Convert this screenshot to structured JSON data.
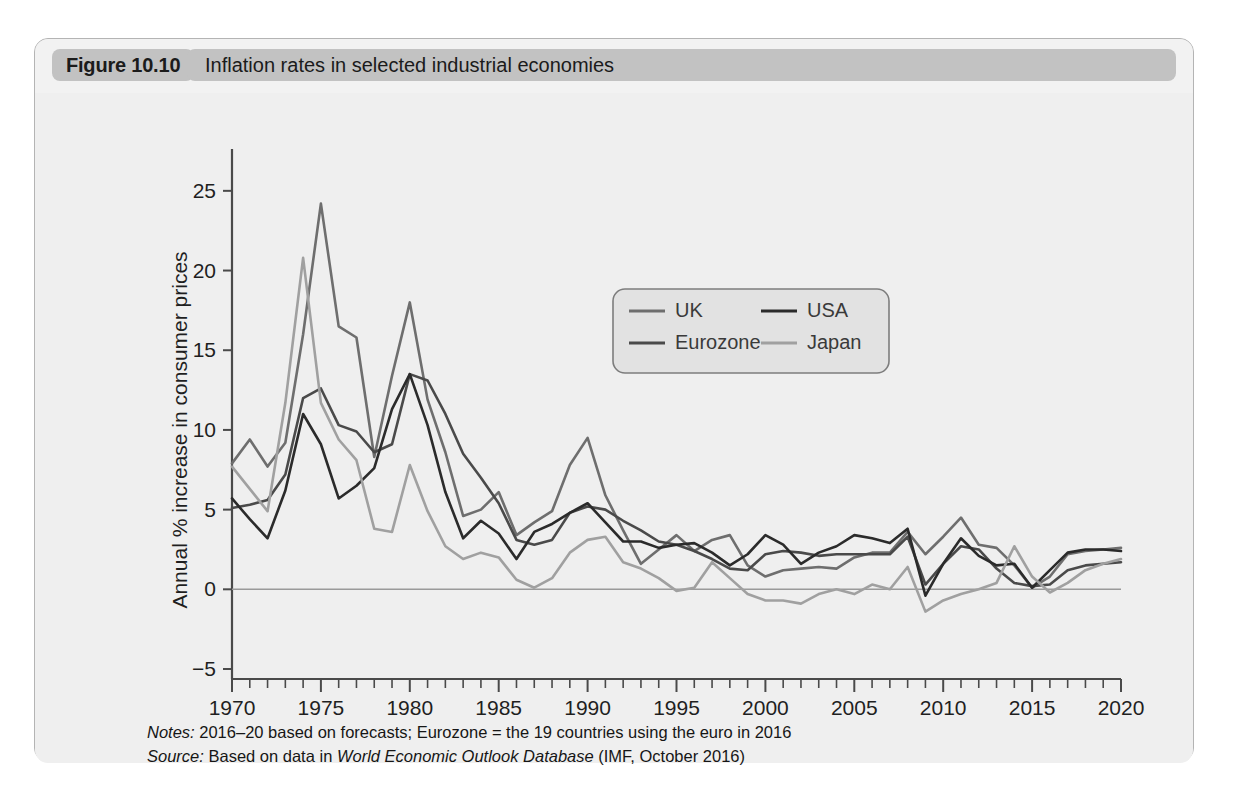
{
  "figure": {
    "badge_label": "Figure 10.10",
    "title": "Inflation rates in selected industrial economies"
  },
  "notes": {
    "notes_lead": "Notes:",
    "notes_text": " 2016–20 based on forecasts; Eurozone = the 19 countries using the euro in 2016",
    "source_lead": "Source:",
    "source_pre": " Based on data in ",
    "source_italic": "World Economic Outlook Database",
    "source_post": " (IMF, October 2016)"
  },
  "colors": {
    "uk": "#6e6e6e",
    "eurozone": "#4a4a4a",
    "usa": "#2b2b2b",
    "japan": "#a0a0a0",
    "axis": "#4a4a4a",
    "zero_line": "#9a9a9a",
    "panel_bg": "#efefef",
    "card_bg": "#d4d4d4",
    "badge_bg": "#c2c2c2"
  },
  "chart_data": {
    "type": "line",
    "title": "Inflation rates in selected industrial economies",
    "xlabel": "",
    "ylabel": "Annual % increase in consumer prices",
    "xlim": [
      1970,
      2020
    ],
    "ylim": [
      -5,
      27.5
    ],
    "yticks": [
      -5,
      0,
      5,
      10,
      15,
      20,
      25
    ],
    "ytick_labels": [
      "−5",
      "0",
      "5",
      "10",
      "15",
      "20",
      "25"
    ],
    "xticks": [
      1970,
      1975,
      1980,
      1985,
      1990,
      1995,
      2000,
      2005,
      2010,
      2015,
      2020
    ],
    "xtick_labels": [
      "1970",
      "1975",
      "1980",
      "1985",
      "1990",
      "1995",
      "2000",
      "2005",
      "2010",
      "2015",
      "2020"
    ],
    "minor_xtick_interval": 1,
    "grid": false,
    "zero_line": true,
    "legend_position": "upper-center",
    "x": [
      1970,
      1971,
      1972,
      1973,
      1974,
      1975,
      1976,
      1977,
      1978,
      1979,
      1980,
      1981,
      1982,
      1983,
      1984,
      1985,
      1986,
      1987,
      1988,
      1989,
      1990,
      1991,
      1992,
      1993,
      1994,
      1995,
      1996,
      1997,
      1998,
      1999,
      2000,
      2001,
      2002,
      2003,
      2004,
      2005,
      2006,
      2007,
      2008,
      2009,
      2010,
      2011,
      2012,
      2013,
      2014,
      2015,
      2016,
      2017,
      2018,
      2019,
      2020
    ],
    "series": [
      {
        "name": "UK",
        "color": "#6e6e6e",
        "values": [
          7.9,
          9.4,
          7.7,
          9.2,
          16.0,
          24.2,
          16.5,
          15.8,
          8.3,
          13.4,
          18.0,
          11.9,
          8.6,
          4.6,
          5.0,
          6.1,
          3.4,
          4.2,
          4.9,
          7.8,
          9.5,
          5.9,
          3.7,
          1.6,
          2.5,
          3.4,
          2.4,
          3.1,
          3.4,
          1.5,
          0.8,
          1.2,
          1.3,
          1.4,
          1.3,
          2.0,
          2.3,
          2.3,
          3.6,
          2.2,
          3.3,
          4.5,
          2.8,
          2.6,
          1.5,
          0.1,
          0.8,
          2.2,
          2.4,
          2.5,
          2.6
        ]
      },
      {
        "name": "Eurozone",
        "color": "#4a4a4a",
        "values": [
          5.1,
          5.3,
          5.6,
          7.2,
          12.0,
          12.6,
          10.3,
          9.9,
          8.6,
          9.1,
          13.5,
          13.1,
          11.0,
          8.5,
          7.0,
          5.4,
          3.1,
          2.8,
          3.1,
          4.8,
          5.2,
          5.0,
          4.3,
          3.7,
          3.0,
          2.8,
          2.4,
          1.9,
          1.3,
          1.2,
          2.2,
          2.4,
          2.3,
          2.1,
          2.2,
          2.2,
          2.2,
          2.2,
          3.3,
          0.3,
          1.6,
          2.7,
          2.5,
          1.3,
          0.4,
          0.2,
          0.3,
          1.2,
          1.5,
          1.6,
          1.7
        ]
      },
      {
        "name": "USA",
        "color": "#2b2b2b",
        "values": [
          5.7,
          4.4,
          3.2,
          6.2,
          11.0,
          9.1,
          5.7,
          6.5,
          7.6,
          11.3,
          13.5,
          10.3,
          6.1,
          3.2,
          4.3,
          3.5,
          1.9,
          3.6,
          4.1,
          4.8,
          5.4,
          4.2,
          3.0,
          3.0,
          2.6,
          2.8,
          2.9,
          2.3,
          1.5,
          2.2,
          3.4,
          2.8,
          1.6,
          2.3,
          2.7,
          3.4,
          3.2,
          2.9,
          3.8,
          -0.4,
          1.6,
          3.2,
          2.1,
          1.5,
          1.6,
          0.1,
          1.2,
          2.3,
          2.5,
          2.5,
          2.4
        ]
      },
      {
        "name": "Japan",
        "color": "#a0a0a0",
        "values": [
          7.7,
          6.3,
          4.9,
          11.7,
          20.8,
          11.7,
          9.4,
          8.1,
          3.8,
          3.6,
          7.8,
          4.9,
          2.7,
          1.9,
          2.3,
          2.0,
          0.6,
          0.1,
          0.7,
          2.3,
          3.1,
          3.3,
          1.7,
          1.3,
          0.7,
          -0.1,
          0.1,
          1.7,
          0.7,
          -0.3,
          -0.7,
          -0.7,
          -0.9,
          -0.3,
          0.0,
          -0.3,
          0.3,
          0.0,
          1.4,
          -1.4,
          -0.7,
          -0.3,
          0.0,
          0.4,
          2.7,
          0.8,
          -0.2,
          0.4,
          1.2,
          1.6,
          1.9
        ]
      }
    ],
    "legend_entries": [
      {
        "label": "UK",
        "color": "#6e6e6e"
      },
      {
        "label": "USA",
        "color": "#2b2b2b"
      },
      {
        "label": "Eurozone",
        "color": "#4a4a4a"
      },
      {
        "label": "Japan",
        "color": "#a0a0a0"
      }
    ]
  }
}
